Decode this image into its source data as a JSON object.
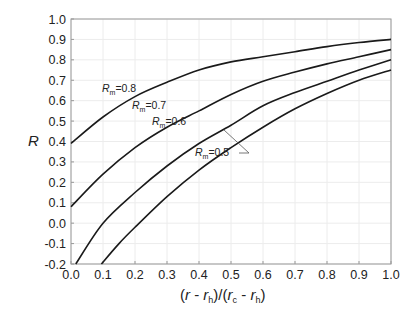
{
  "chart_data": {
    "type": "line",
    "title": "",
    "xlabel": "(r - r_h)/(r_c - r_h)",
    "ylabel": "R",
    "xlim": [
      0.0,
      1.0
    ],
    "ylim": [
      -0.2,
      1.0
    ],
    "x_ticks": [
      "0.0",
      "0.1",
      "0.2",
      "0.3",
      "0.4",
      "0.5",
      "0.6",
      "0.7",
      "0.8",
      "0.9",
      "1.0"
    ],
    "y_ticks": [
      "-0.2",
      "-0.1",
      "0.0",
      "0.1",
      "0.2",
      "0.3",
      "0.4",
      "0.5",
      "0.6",
      "0.7",
      "0.8",
      "0.9",
      "1.0"
    ],
    "grid": true,
    "legend": "inline labels",
    "series": [
      {
        "name": "R_m=0.8",
        "label_main": "R",
        "label_sub": "m",
        "label_val": "=0.8",
        "x": [
          0.0,
          0.1,
          0.2,
          0.3,
          0.4,
          0.5,
          0.6,
          0.7,
          0.8,
          0.9,
          1.0
        ],
        "y": [
          0.39,
          0.52,
          0.62,
          0.69,
          0.75,
          0.79,
          0.815,
          0.84,
          0.865,
          0.885,
          0.9
        ]
      },
      {
        "name": "R_m=0.7",
        "label_main": "R",
        "label_sub": "m",
        "label_val": "=0.7",
        "x": [
          0.0,
          0.1,
          0.2,
          0.3,
          0.4,
          0.5,
          0.6,
          0.7,
          0.8,
          0.9,
          1.0
        ],
        "y": [
          0.08,
          0.24,
          0.37,
          0.47,
          0.55,
          0.63,
          0.695,
          0.74,
          0.78,
          0.815,
          0.85
        ]
      },
      {
        "name": "R_m=0.6",
        "label_main": "R",
        "label_sub": "m",
        "label_val": "=0.6",
        "x": [
          0.015,
          0.1,
          0.2,
          0.3,
          0.4,
          0.5,
          0.6,
          0.7,
          0.8,
          0.9,
          1.0
        ],
        "y": [
          -0.2,
          0.0,
          0.15,
          0.28,
          0.39,
          0.48,
          0.575,
          0.64,
          0.695,
          0.75,
          0.8
        ]
      },
      {
        "name": "R_m=0.5",
        "label_main": "R",
        "label_sub": "m",
        "label_val": "=0.5",
        "x": [
          0.095,
          0.15,
          0.2,
          0.3,
          0.4,
          0.5,
          0.6,
          0.7,
          0.8,
          0.9,
          1.0
        ],
        "y": [
          -0.2,
          -0.1,
          -0.02,
          0.13,
          0.26,
          0.37,
          0.47,
          0.56,
          0.635,
          0.7,
          0.75
        ]
      }
    ]
  },
  "labels": {
    "y_axis": "R",
    "x_axis_parts": [
      "(",
      "r",
      " - ",
      "r",
      "h",
      ")/(",
      "r",
      "c",
      " - ",
      "r",
      "h",
      ")"
    ]
  }
}
